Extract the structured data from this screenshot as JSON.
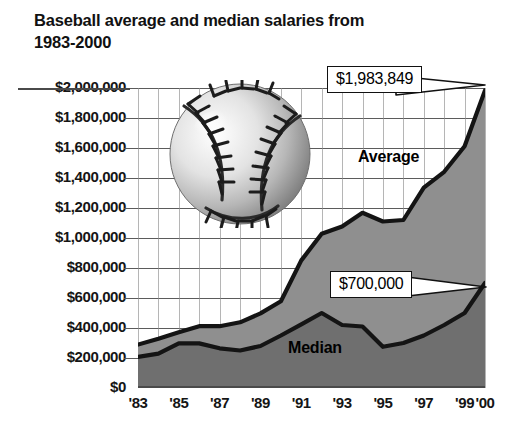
{
  "title": "Baseball average and median salaries from\n1983-2000",
  "colors": {
    "area_average": "#8f8f8f",
    "area_median": "#7d7d7d",
    "line": "#1a1a1a",
    "gridline": "#5b5b5b",
    "text": "#151515",
    "background": "#ffffff"
  },
  "axes": {
    "y_tick_labels": [
      "$2,000,000",
      "$1,800,000",
      "$1,600,000",
      "$1,400,000",
      "$1,200,000",
      "$1,000,000",
      "$800,000",
      "$600,000",
      "$400,000",
      "$200,000",
      "$0"
    ],
    "x_tick_labels": [
      "'83",
      "'85",
      "'87",
      "'89",
      "'91",
      "'93",
      "'95",
      "'97",
      "'99",
      "'00"
    ]
  },
  "annotations": {
    "average_series_label": "Average",
    "median_series_label": "Median",
    "average_callout": "$1,983,849",
    "median_callout": "$700,000"
  },
  "decoration": {
    "baseball_icon": "baseball-icon"
  },
  "chart_data": {
    "type": "area",
    "title": "Baseball average and median salaries from 1983-2000",
    "subtitle": "",
    "xlabel": "",
    "ylabel": "",
    "ylim": [
      0,
      2000000
    ],
    "ytick_step": 200000,
    "grid": true,
    "legend": "inline-labels",
    "x": [
      "'83",
      "'84",
      "'85",
      "'86",
      "'87",
      "'88",
      "'89",
      "'90",
      "'91",
      "'92",
      "'93",
      "'94",
      "'95",
      "'96",
      "'97",
      "'98",
      "'99",
      "'00"
    ],
    "years": [
      1983,
      1984,
      1985,
      1986,
      1987,
      1988,
      1989,
      1990,
      1991,
      1992,
      1993,
      1994,
      1995,
      1996,
      1997,
      1998,
      1999,
      2000
    ],
    "series": [
      {
        "name": "Average",
        "values": [
          289000,
          329000,
          371000,
          412000,
          412000,
          438000,
          497000,
          578000,
          851000,
          1028000,
          1076000,
          1168000,
          1110000,
          1120000,
          1336000,
          1441000,
          1611000,
          1983849
        ],
        "end_label": "$1,983,849"
      },
      {
        "name": "Median",
        "values": [
          207000,
          229000,
          297000,
          297000,
          265000,
          250000,
          280000,
          350000,
          425000,
          500000,
          420000,
          410000,
          275000,
          300000,
          350000,
          420000,
          500000,
          700000
        ],
        "end_label": "$700,000"
      }
    ],
    "final_values": {
      "average": 1983849,
      "median": 700000
    }
  }
}
